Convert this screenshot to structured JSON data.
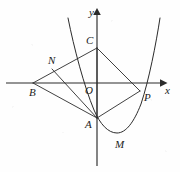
{
  "figure": {
    "kind": "coordinate-geometry-diagram",
    "axes": {
      "x_label": "x",
      "y_label": "y",
      "origin_label": "O",
      "x_axis_y_px": 83,
      "y_axis_x_px": 97,
      "x_axis_start_px": 6,
      "x_axis_end_px": 163,
      "y_axis_top_px": 9,
      "y_axis_bottom_px": 166
    },
    "points": [
      {
        "label": "B",
        "x": 33,
        "y": 83,
        "label_dx": -4,
        "label_dy": 4,
        "on": "x-axis"
      },
      {
        "label": "N",
        "x": 52,
        "y": 69,
        "label_dx": -4,
        "label_dy": -14,
        "on": "segment-BC"
      },
      {
        "label": "C",
        "x": 97,
        "y": 48,
        "label_dx": -11,
        "label_dy": -13,
        "on": "y-axis"
      },
      {
        "label": "O",
        "x": 97,
        "y": 83,
        "label_dx": -12,
        "label_dy": 2,
        "on": "origin"
      },
      {
        "label": "P",
        "x": 140,
        "y": 91,
        "label_dx": 4,
        "label_dy": 1,
        "on": "x-axis"
      },
      {
        "label": "A",
        "x": 97,
        "y": 118,
        "label_dx": -12,
        "label_dy": 1,
        "on": "y-axis"
      },
      {
        "label": "M",
        "x": 118,
        "y": 133,
        "label_dx": 0,
        "label_dy": 6,
        "on": "parabola-vertex"
      }
    ],
    "segments": [
      {
        "name": "segment-B-C",
        "from": "B",
        "to": "C"
      },
      {
        "name": "segment-B-A",
        "from": "B",
        "to": "A"
      },
      {
        "name": "segment-N-A",
        "from": "N",
        "to": "A"
      },
      {
        "name": "segment-A-C",
        "from": "A",
        "to": "C"
      },
      {
        "name": "segment-C-P",
        "from": "C",
        "to": "P"
      },
      {
        "name": "segment-A-P",
        "from": "A",
        "to": "P"
      }
    ],
    "curve": {
      "name": "parabola",
      "opens": "up",
      "vertex_label": "M",
      "passes_through": [
        "A",
        "M",
        "P"
      ],
      "path": "M 68,18 C 74,48 84,86 94,110 C 100,124 108,133 117,133 C 126,133 134,122 141,104 C 149,80 156,44 160,18"
    }
  }
}
